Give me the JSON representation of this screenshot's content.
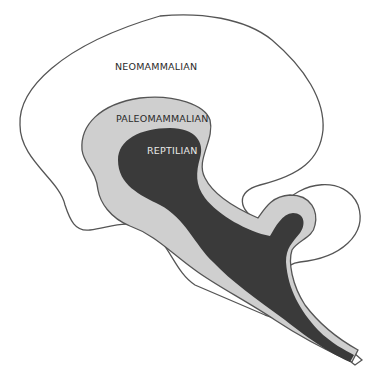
{
  "diagram": {
    "type": "triune-brain",
    "colors": {
      "outline": "#555555",
      "neomammalian_fill": "#ffffff",
      "paleomammalian_fill": "#cfcfcf",
      "reptilian_fill": "#3a3a3a"
    },
    "labels": {
      "neomammalian": "NEOMAMMALIAN",
      "paleomammalian": "PALEOMAMMALIAN",
      "reptilian": "REPTILIAN"
    }
  }
}
